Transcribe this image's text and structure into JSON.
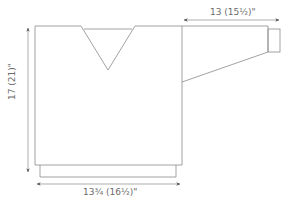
{
  "diagram": {
    "type": "sweater-schematic",
    "colors": {
      "outline": "#8a8a8a",
      "arrow": "#555555",
      "text": "#6b6b6b"
    },
    "labels": {
      "body_width": "13¾ (16½)\"",
      "body_length": "17 (21)\"",
      "sleeve_length": "13 (15½)\""
    },
    "parts": [
      "body",
      "v-neck",
      "sleeve",
      "cuff",
      "hem-ribbing"
    ]
  }
}
